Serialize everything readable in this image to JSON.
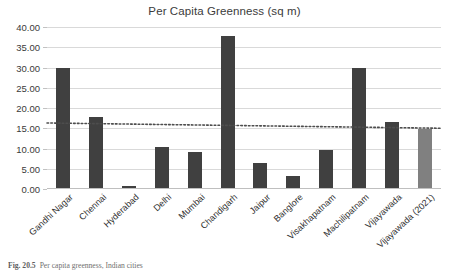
{
  "figure": {
    "caption_number": "Fig. 20.5",
    "caption_text": "Per capita greenness, Indian cities"
  },
  "chart_data": {
    "type": "bar",
    "title": "Per Capita Greenness (sq m)",
    "xlabel": "",
    "ylabel": "",
    "ylim": [
      0,
      40
    ],
    "ytick_step": 5,
    "grid": true,
    "legend": "none",
    "categories": [
      "Gandhi Nagar",
      "Chennai",
      "Hyderabad",
      "Delhi",
      "Mumbai",
      "Chandigarh",
      "Jaipur",
      "Banglore",
      "Visakhapatnam",
      "Machilipatnam",
      "Vijayawada",
      "Vijayawada (2021)"
    ],
    "values": [
      29.8,
      17.9,
      0.8,
      10.3,
      9.2,
      37.8,
      6.5,
      3.1,
      9.7,
      29.8,
      16.6,
      14.9
    ],
    "bar_colors": [
      "#404040",
      "#404040",
      "#404040",
      "#404040",
      "#404040",
      "#404040",
      "#404040",
      "#404040",
      "#404040",
      "#404040",
      "#404040",
      "#808080"
    ],
    "ytick_labels": [
      "0.00",
      "5.00",
      "10.00",
      "15.00",
      "20.00",
      "25.00",
      "30.00",
      "35.00",
      "40.00"
    ],
    "ytick_values": [
      0,
      5,
      10,
      15,
      20,
      25,
      30,
      35,
      40
    ],
    "trendline": {
      "style": "dotted",
      "color": "#4d4d4d",
      "start_value": 16.3,
      "end_value": 15.0
    }
  },
  "colors": {
    "bar_dark": "#404040",
    "bar_grey": "#808080",
    "gridline": "#d9d9d9",
    "text": "#2f2f2f"
  }
}
